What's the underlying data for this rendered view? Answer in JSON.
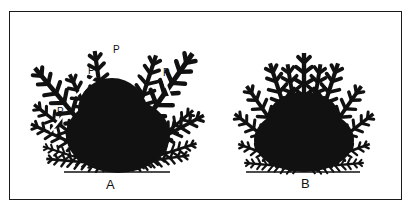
{
  "figure": {
    "shrubs": [
      {
        "id": "A",
        "label": "A",
        "description": "overgrown shrub with long uneven branches marked for pruning",
        "prune_marker_text": "P",
        "prune_marker_count": 4
      },
      {
        "id": "B",
        "label": "B",
        "description": "compact, evenly shaped shrub after pruning"
      }
    ],
    "colors": {
      "ink": "#111111",
      "paper": "#ffffff"
    }
  }
}
